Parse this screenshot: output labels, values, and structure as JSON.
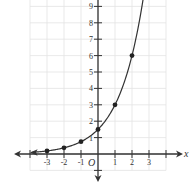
{
  "chart_data": {
    "type": "line",
    "title": "",
    "xlabel": "x",
    "ylabel": "",
    "origin_label": "O",
    "function": "y = 1.5 * 2^x",
    "x_ticks": [
      "-3",
      "-2",
      "-1",
      "1",
      "2",
      "3"
    ],
    "y_ticks": [
      "1",
      "2",
      "3",
      "4",
      "5",
      "6",
      "7",
      "8",
      "9"
    ],
    "xlim": [
      -4,
      4
    ],
    "ylim": [
      -1,
      10
    ],
    "grid": true,
    "legend": null,
    "points": [
      {
        "x": -3,
        "y": 0.1875
      },
      {
        "x": -2,
        "y": 0.375
      },
      {
        "x": -1,
        "y": 0.75
      },
      {
        "x": 0,
        "y": 1.5
      },
      {
        "x": 1,
        "y": 3
      },
      {
        "x": 2,
        "y": 6
      }
    ],
    "series": [
      {
        "name": "exponential curve",
        "x": [
          -3,
          -2,
          -1,
          0,
          1,
          2
        ],
        "values": [
          0.1875,
          0.375,
          0.75,
          1.5,
          3,
          6
        ]
      }
    ],
    "colors": {
      "axis": "#333333",
      "curve": "#333333",
      "grid": "#e3e3e3",
      "point": "#222222"
    }
  }
}
